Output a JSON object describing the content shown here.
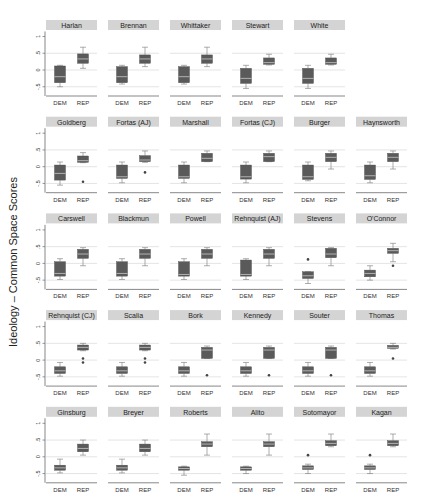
{
  "chart_data": {
    "type": "box",
    "title": "",
    "ylabel": "Ideology – Common Space Scores",
    "xlabel": "",
    "categories": [
      "DEM",
      "REP"
    ],
    "yticks": [
      1,
      0.5,
      0,
      -0.5
    ],
    "ytick_labels": [
      "1",
      ".5",
      "0",
      "-.5"
    ],
    "ylim": [
      -0.75,
      1.2
    ],
    "grid": true,
    "colors": {
      "box": "#5a5a5a",
      "median": "#c8c8c8",
      "strip": "#d4d4d4",
      "grid": "#d9d9d9",
      "axis": "#555555"
    },
    "panels": [
      {
        "title": "Harlan",
        "boxes": [
          {
            "group": "DEM",
            "whislo": -0.5,
            "q1": -0.38,
            "med": -0.2,
            "q3": 0.12,
            "whishi": 0.14,
            "outliers": []
          },
          {
            "group": "REP",
            "whislo": 0.05,
            "q1": 0.2,
            "med": 0.33,
            "q3": 0.48,
            "whishi": 0.68,
            "outliers": []
          }
        ]
      },
      {
        "title": "Brennan",
        "boxes": [
          {
            "group": "DEM",
            "whislo": -0.42,
            "q1": -0.38,
            "med": -0.2,
            "q3": 0.1,
            "whishi": 0.14,
            "outliers": []
          },
          {
            "group": "REP",
            "whislo": 0.1,
            "q1": 0.2,
            "med": 0.33,
            "q3": 0.45,
            "whishi": 0.68,
            "outliers": []
          }
        ]
      },
      {
        "title": "Whittaker",
        "boxes": [
          {
            "group": "DEM",
            "whislo": -0.42,
            "q1": -0.38,
            "med": -0.2,
            "q3": 0.1,
            "whishi": 0.14,
            "outliers": []
          },
          {
            "group": "REP",
            "whislo": 0.1,
            "q1": 0.2,
            "med": 0.33,
            "q3": 0.45,
            "whishi": 0.68,
            "outliers": []
          }
        ]
      },
      {
        "title": "Stewart",
        "boxes": [
          {
            "group": "DEM",
            "whislo": -0.55,
            "q1": -0.4,
            "med": -0.25,
            "q3": 0.05,
            "whishi": 0.14,
            "outliers": []
          },
          {
            "group": "REP",
            "whislo": 0.15,
            "q1": 0.17,
            "med": 0.22,
            "q3": 0.36,
            "whishi": 0.47,
            "outliers": []
          }
        ]
      },
      {
        "title": "White",
        "boxes": [
          {
            "group": "DEM",
            "whislo": -0.55,
            "q1": -0.4,
            "med": -0.25,
            "q3": 0.05,
            "whishi": 0.14,
            "outliers": []
          },
          {
            "group": "REP",
            "whislo": 0.15,
            "q1": 0.17,
            "med": 0.22,
            "q3": 0.36,
            "whishi": 0.47,
            "outliers": []
          }
        ]
      },
      {
        "title": "Goldberg",
        "boxes": [
          {
            "group": "DEM",
            "whislo": -0.55,
            "q1": -0.4,
            "med": -0.2,
            "q3": 0.05,
            "whishi": 0.14,
            "outliers": []
          },
          {
            "group": "REP",
            "whislo": 0.12,
            "q1": 0.13,
            "med": 0.18,
            "q3": 0.32,
            "whishi": 0.42,
            "outliers": [
              -0.45
            ]
          }
        ]
      },
      {
        "title": "Fortas (AJ)",
        "boxes": [
          {
            "group": "DEM",
            "whislo": -0.48,
            "q1": -0.35,
            "med": -0.3,
            "q3": 0.05,
            "whishi": 0.14,
            "outliers": []
          },
          {
            "group": "REP",
            "whislo": 0.13,
            "q1": 0.15,
            "med": 0.2,
            "q3": 0.33,
            "whishi": 0.47,
            "outliers": [
              -0.17
            ]
          }
        ]
      },
      {
        "title": "Marshall",
        "boxes": [
          {
            "group": "DEM",
            "whislo": -0.48,
            "q1": -0.35,
            "med": -0.3,
            "q3": 0.05,
            "whishi": 0.14,
            "outliers": []
          },
          {
            "group": "REP",
            "whislo": 0.15,
            "q1": 0.15,
            "med": 0.25,
            "q3": 0.4,
            "whishi": 0.47,
            "outliers": []
          }
        ]
      },
      {
        "title": "Fortas (CJ)",
        "boxes": [
          {
            "group": "DEM",
            "whislo": -0.48,
            "q1": -0.37,
            "med": -0.3,
            "q3": 0.05,
            "whishi": 0.14,
            "outliers": []
          },
          {
            "group": "REP",
            "whislo": 0.15,
            "q1": 0.15,
            "med": 0.3,
            "q3": 0.4,
            "whishi": 0.47,
            "outliers": []
          }
        ]
      },
      {
        "title": "Burger",
        "boxes": [
          {
            "group": "DEM",
            "whislo": -0.42,
            "q1": -0.38,
            "med": -0.3,
            "q3": 0.05,
            "whishi": 0.14,
            "outliers": []
          },
          {
            "group": "REP",
            "whislo": -0.07,
            "q1": 0.15,
            "med": 0.28,
            "q3": 0.4,
            "whishi": 0.47,
            "outliers": []
          }
        ]
      },
      {
        "title": "Haynsworth",
        "boxes": [
          {
            "group": "DEM",
            "whislo": -0.48,
            "q1": -0.38,
            "med": -0.27,
            "q3": 0.05,
            "whishi": 0.14,
            "outliers": []
          },
          {
            "group": "REP",
            "whislo": -0.07,
            "q1": 0.15,
            "med": 0.28,
            "q3": 0.4,
            "whishi": 0.47,
            "outliers": []
          }
        ]
      },
      {
        "title": "Carswell",
        "boxes": [
          {
            "group": "DEM",
            "whislo": -0.48,
            "q1": -0.38,
            "med": -0.3,
            "q3": 0.05,
            "whishi": 0.14,
            "outliers": []
          },
          {
            "group": "REP",
            "whislo": -0.07,
            "q1": 0.15,
            "med": 0.28,
            "q3": 0.42,
            "whishi": 0.47,
            "outliers": []
          }
        ]
      },
      {
        "title": "Blackmun",
        "boxes": [
          {
            "group": "DEM",
            "whislo": -0.48,
            "q1": -0.38,
            "med": -0.3,
            "q3": 0.05,
            "whishi": 0.14,
            "outliers": []
          },
          {
            "group": "REP",
            "whislo": -0.07,
            "q1": 0.15,
            "med": 0.28,
            "q3": 0.42,
            "whishi": 0.47,
            "outliers": []
          }
        ]
      },
      {
        "title": "Powell",
        "boxes": [
          {
            "group": "DEM",
            "whislo": -0.48,
            "q1": -0.38,
            "med": -0.33,
            "q3": 0.05,
            "whishi": 0.14,
            "outliers": []
          },
          {
            "group": "REP",
            "whislo": -0.07,
            "q1": 0.15,
            "med": 0.28,
            "q3": 0.42,
            "whishi": 0.47,
            "outliers": []
          }
        ]
      },
      {
        "title": "Rehnquist (AJ)",
        "boxes": [
          {
            "group": "DEM",
            "whislo": -0.48,
            "q1": -0.38,
            "med": -0.33,
            "q3": 0.1,
            "whishi": 0.14,
            "outliers": []
          },
          {
            "group": "REP",
            "whislo": -0.07,
            "q1": 0.15,
            "med": 0.28,
            "q3": 0.42,
            "whishi": 0.47,
            "outliers": []
          }
        ]
      },
      {
        "title": "Stevens",
        "boxes": [
          {
            "group": "DEM",
            "whislo": -0.6,
            "q1": -0.45,
            "med": -0.37,
            "q3": -0.25,
            "whishi": -0.25,
            "outliers": [
              0.12
            ]
          },
          {
            "group": "REP",
            "whislo": -0.07,
            "q1": 0.17,
            "med": 0.28,
            "q3": 0.45,
            "whishi": 0.47,
            "outliers": []
          }
        ]
      },
      {
        "title": "O'Connor",
        "boxes": [
          {
            "group": "DEM",
            "whislo": -0.5,
            "q1": -0.4,
            "med": -0.3,
            "q3": -0.2,
            "whishi": -0.07,
            "outliers": []
          },
          {
            "group": "REP",
            "whislo": 0.05,
            "q1": 0.3,
            "med": 0.38,
            "q3": 0.45,
            "whishi": 0.6,
            "outliers": [
              -0.07
            ]
          }
        ]
      },
      {
        "title": "Rehnquist (CJ)",
        "boxes": [
          {
            "group": "DEM",
            "whislo": -0.48,
            "q1": -0.4,
            "med": -0.32,
            "q3": -0.2,
            "whishi": -0.07,
            "outliers": []
          },
          {
            "group": "REP",
            "whislo": 0.28,
            "q1": 0.3,
            "med": 0.38,
            "q3": 0.45,
            "whishi": 0.5,
            "outliers": [
              0.05,
              -0.07
            ]
          }
        ]
      },
      {
        "title": "Scalia",
        "boxes": [
          {
            "group": "DEM",
            "whislo": -0.48,
            "q1": -0.4,
            "med": -0.32,
            "q3": -0.2,
            "whishi": -0.07,
            "outliers": []
          },
          {
            "group": "REP",
            "whislo": 0.28,
            "q1": 0.3,
            "med": 0.38,
            "q3": 0.45,
            "whishi": 0.5,
            "outliers": [
              0.05,
              -0.07
            ]
          }
        ]
      },
      {
        "title": "Bork",
        "boxes": [
          {
            "group": "DEM",
            "whislo": -0.48,
            "q1": -0.4,
            "med": -0.32,
            "q3": -0.2,
            "whishi": -0.07,
            "outliers": []
          },
          {
            "group": "REP",
            "whislo": 0.05,
            "q1": 0.05,
            "med": 0.3,
            "q3": 0.38,
            "whishi": 0.42,
            "outliers": [
              -0.45
            ]
          }
        ]
      },
      {
        "title": "Kennedy",
        "boxes": [
          {
            "group": "DEM",
            "whislo": -0.48,
            "q1": -0.4,
            "med": -0.32,
            "q3": -0.2,
            "whishi": -0.07,
            "outliers": []
          },
          {
            "group": "REP",
            "whislo": 0.05,
            "q1": 0.05,
            "med": 0.3,
            "q3": 0.38,
            "whishi": 0.42,
            "outliers": [
              -0.45
            ]
          }
        ]
      },
      {
        "title": "Souter",
        "boxes": [
          {
            "group": "DEM",
            "whislo": -0.48,
            "q1": -0.4,
            "med": -0.32,
            "q3": -0.2,
            "whishi": -0.07,
            "outliers": []
          },
          {
            "group": "REP",
            "whislo": 0.05,
            "q1": 0.05,
            "med": 0.3,
            "q3": 0.38,
            "whishi": 0.42,
            "outliers": [
              -0.45
            ]
          }
        ]
      },
      {
        "title": "Thomas",
        "boxes": [
          {
            "group": "DEM",
            "whislo": -0.48,
            "q1": -0.4,
            "med": -0.32,
            "q3": -0.2,
            "whishi": -0.07,
            "outliers": []
          },
          {
            "group": "REP",
            "whislo": 0.33,
            "q1": 0.35,
            "med": 0.38,
            "q3": 0.44,
            "whishi": 0.5,
            "outliers": [
              0.05
            ]
          }
        ]
      },
      {
        "title": "Ginsburg",
        "boxes": [
          {
            "group": "DEM",
            "whislo": -0.48,
            "q1": -0.4,
            "med": -0.33,
            "q3": -0.25,
            "whishi": -0.07,
            "outliers": []
          },
          {
            "group": "REP",
            "whislo": 0.05,
            "q1": 0.15,
            "med": 0.25,
            "q3": 0.38,
            "whishi": 0.5,
            "outliers": []
          }
        ]
      },
      {
        "title": "Breyer",
        "boxes": [
          {
            "group": "DEM",
            "whislo": -0.48,
            "q1": -0.4,
            "med": -0.33,
            "q3": -0.25,
            "whishi": -0.07,
            "outliers": []
          },
          {
            "group": "REP",
            "whislo": 0.05,
            "q1": 0.15,
            "med": 0.25,
            "q3": 0.38,
            "whishi": 0.5,
            "outliers": []
          }
        ]
      },
      {
        "title": "Roberts",
        "boxes": [
          {
            "group": "DEM",
            "whislo": -0.55,
            "q1": -0.4,
            "med": -0.35,
            "q3": -0.3,
            "whishi": -0.28,
            "outliers": []
          },
          {
            "group": "REP",
            "whislo": 0.05,
            "q1": 0.3,
            "med": 0.38,
            "q3": 0.45,
            "whishi": 0.68,
            "outliers": []
          }
        ]
      },
      {
        "title": "Alito",
        "boxes": [
          {
            "group": "DEM",
            "whislo": -0.5,
            "q1": -0.4,
            "med": -0.35,
            "q3": -0.3,
            "whishi": -0.28,
            "outliers": []
          },
          {
            "group": "REP",
            "whislo": 0.05,
            "q1": 0.3,
            "med": 0.38,
            "q3": 0.45,
            "whishi": 0.68,
            "outliers": []
          }
        ]
      },
      {
        "title": "Sotomayor",
        "boxes": [
          {
            "group": "DEM",
            "whislo": -0.5,
            "q1": -0.38,
            "med": -0.33,
            "q3": -0.27,
            "whishi": -0.22,
            "outliers": [
              0.05
            ]
          },
          {
            "group": "REP",
            "whislo": 0.3,
            "q1": 0.33,
            "med": 0.4,
            "q3": 0.48,
            "whishi": 0.68,
            "outliers": []
          }
        ]
      },
      {
        "title": "Kagan",
        "boxes": [
          {
            "group": "DEM",
            "whislo": -0.5,
            "q1": -0.38,
            "med": -0.33,
            "q3": -0.27,
            "whishi": -0.22,
            "outliers": [
              0.05
            ]
          },
          {
            "group": "REP",
            "whislo": 0.3,
            "q1": 0.33,
            "med": 0.4,
            "q3": 0.48,
            "whishi": 0.68,
            "outliers": []
          }
        ]
      }
    ],
    "layout": {
      "rows": [
        5,
        6,
        6,
        6,
        6
      ]
    }
  }
}
